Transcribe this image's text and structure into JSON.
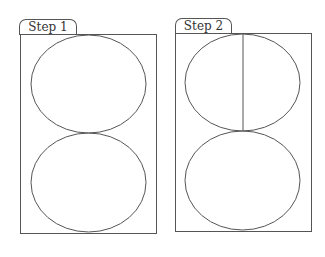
{
  "panels": [
    {
      "label": "Step 1",
      "shapes": [
        "top-circle",
        "bottom-circle"
      ]
    },
    {
      "label": "Step 2",
      "shapes": [
        "top-circle-divided-in-half",
        "bottom-circle"
      ]
    }
  ],
  "colors": {
    "stroke": "#555555",
    "background": "#ffffff"
  }
}
